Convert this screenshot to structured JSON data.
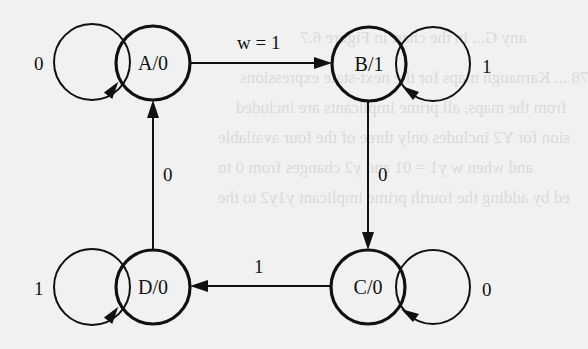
{
  "diagram": {
    "type": "finite-state-machine (Moore)",
    "states": [
      {
        "id": "A",
        "label": "A/0",
        "output": "0",
        "cx": 153,
        "cy": 63
      },
      {
        "id": "B",
        "label": "B/1",
        "output": "1",
        "cx": 369,
        "cy": 64
      },
      {
        "id": "C",
        "label": "C/0",
        "output": "0",
        "cx": 368,
        "cy": 287
      },
      {
        "id": "D",
        "label": "D/0",
        "output": "0",
        "cx": 153,
        "cy": 287
      }
    ],
    "transitions": [
      {
        "from": "A",
        "to": "A",
        "label": "0"
      },
      {
        "from": "A",
        "to": "B",
        "label": "w = 1"
      },
      {
        "from": "B",
        "to": "B",
        "label": "1"
      },
      {
        "from": "B",
        "to": "C",
        "label": "0"
      },
      {
        "from": "C",
        "to": "C",
        "label": "0"
      },
      {
        "from": "C",
        "to": "D",
        "label": "1"
      },
      {
        "from": "D",
        "to": "D",
        "label": "1"
      },
      {
        "from": "D",
        "to": "A",
        "label": "0"
      }
    ]
  },
  "labels": {
    "state_a": "A/0",
    "state_b": "B/1",
    "state_c": "C/0",
    "state_d": "D/0",
    "loop_a": "0",
    "loop_b": "1",
    "loop_c": "0",
    "loop_d": "1",
    "edge_ab": "w = 1",
    "edge_bc": "0",
    "edge_cd": "1",
    "edge_da": "0"
  },
  "bleed_through": {
    "lines": [
      "any G... in the chart in Figure 6.7",
      "78 ... Karnaugh maps for the next-state expressions",
      "from the maps, all prime implicants are included",
      "sion for Y2 includes only three of the four available",
      "and when w y1 = 01 and y2 changes from 0 to",
      "ed by adding the fourth prime implicant y1y2 to the"
    ]
  }
}
